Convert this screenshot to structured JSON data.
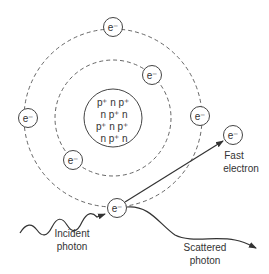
{
  "diagram": {
    "nucleus": {
      "rows": [
        "p⁺ n p⁺",
        "n p⁺ n",
        "p⁺ n p⁺",
        "n p⁺ n"
      ]
    },
    "electron_label": "e⁻",
    "labels": {
      "fast_electron_line1": "Fast",
      "fast_electron_line2": "electron",
      "incident_photon_line1": "Incident",
      "incident_photon_line2": "photon",
      "scattered_photon_line1": "Scattered",
      "scattered_photon_line2": "photon"
    },
    "colors": {
      "stroke": "#444444",
      "text": "#333333"
    }
  }
}
